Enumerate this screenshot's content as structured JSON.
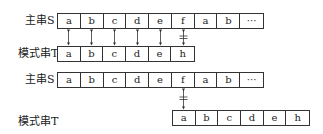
{
  "diagram_1": {
    "main_label": "主串S",
    "pattern_label": "模式串T",
    "main_cells": [
      "a",
      "b",
      "c",
      "d",
      "e",
      "f",
      "a",
      "b",
      "···"
    ],
    "pattern_cells": [
      "a",
      "b",
      "c",
      "d",
      "e",
      "h"
    ],
    "match_arrows": [
      "equal",
      "equal",
      "equal",
      "equal",
      "equal",
      "not-equal"
    ]
  },
  "diagram_2": {
    "main_label": "主串S",
    "pattern_label": "模式串T",
    "main_cells": [
      "a",
      "b",
      "c",
      "d",
      "e",
      "f",
      "a",
      "b",
      "···"
    ],
    "pattern_cells": [
      "a",
      "b",
      "c",
      "d",
      "e",
      "h"
    ],
    "match_arrows": [
      "not-equal"
    ]
  }
}
